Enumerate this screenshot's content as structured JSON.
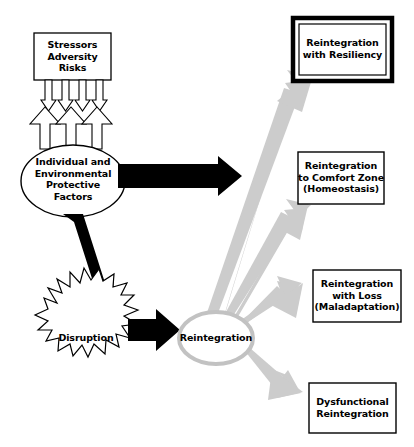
{
  "diagram": {
    "colors": {
      "stroke": "#000000",
      "arrow_black": "#000000",
      "arrow_gray": "#cccccc",
      "gray_outline": "#c4c4c4",
      "background": "#ffffff"
    },
    "nodes": {
      "stressors_box": {
        "lines": [
          "Stressors",
          "Adversity",
          "Risks"
        ]
      },
      "protective_ellipse": {
        "lines": [
          "Individual and",
          "Environmental",
          "Protective",
          "Factors"
        ]
      },
      "disruption_burst": {
        "lines": [
          "Disruption"
        ]
      },
      "reintegration_ellipse": {
        "lines": [
          "Reintegration"
        ]
      }
    },
    "outcomes": [
      {
        "id": "reintegration-with-resiliency",
        "lines": [
          "Reintegration",
          "with Resiliency"
        ],
        "emphasis": "double-border"
      },
      {
        "id": "reintegration-to-comfort-zone",
        "lines": [
          "Reintegration",
          "to Comfort Zone",
          "(Homeostasis)"
        ],
        "emphasis": "single-border"
      },
      {
        "id": "reintegration-with-loss",
        "lines": [
          "Reintegration",
          "with Loss",
          "(Maladaptation)"
        ],
        "emphasis": "single-border"
      },
      {
        "id": "dysfunctional-reintegration",
        "lines": [
          "Dysfunctional",
          "Reintegration"
        ],
        "emphasis": "single-border"
      }
    ],
    "connectors": [
      {
        "id": "stressors-to-protective",
        "style": "thin-down-arrows",
        "count": 4
      },
      {
        "id": "protective-up-arrows",
        "style": "hollow-up-arrows",
        "count": 3
      },
      {
        "id": "protective-to-resiliency",
        "style": "solid-black-arrow"
      },
      {
        "id": "protective-to-disruption",
        "style": "solid-black-arrow"
      },
      {
        "id": "disruption-to-reintegration",
        "style": "solid-black-arrow"
      },
      {
        "id": "reintegration-to-resiliency",
        "style": "gray-arrow"
      },
      {
        "id": "reintegration-to-comfort-zone",
        "style": "gray-arrow"
      },
      {
        "id": "reintegration-to-loss",
        "style": "gray-arrow"
      },
      {
        "id": "reintegration-to-dysfunctional",
        "style": "gray-arrow"
      }
    ]
  }
}
